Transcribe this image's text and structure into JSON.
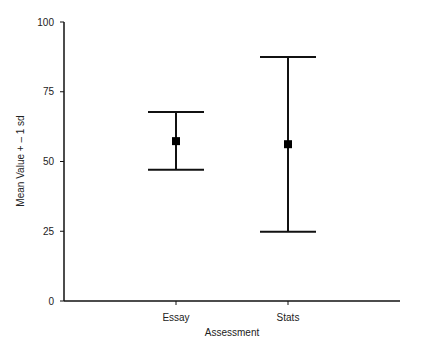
{
  "chart_data": {
    "type": "errorbar",
    "title": "",
    "xlabel": "Assessment",
    "ylabel": "Mean Value + – 1 sd",
    "ylim": [
      0,
      100
    ],
    "yticks": [
      0,
      25,
      50,
      75,
      100
    ],
    "categories": [
      "Essay",
      "Stats"
    ],
    "series": [
      {
        "name": "Mean ± 1 sd",
        "mean": [
          57.3,
          56.2
        ],
        "upper": [
          67.7,
          87.5
        ],
        "lower": [
          47.0,
          24.8
        ]
      }
    ],
    "grid": false,
    "legend": null
  },
  "colors": {
    "line": "#111111",
    "marker": "#000000",
    "text": "#222222"
  }
}
